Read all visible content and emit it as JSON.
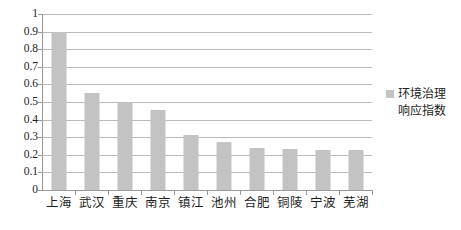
{
  "chart_data": {
    "type": "bar",
    "title": "",
    "subtitle": "",
    "xlabel": "",
    "ylabel": "",
    "ylim": [
      0,
      1
    ],
    "ytick_labels": [
      "1",
      "0.9",
      "0.8",
      "0.7",
      "0.6",
      "0.5",
      "0.4",
      "0.3",
      "0.2",
      "0.1",
      "0"
    ],
    "ytick_values": [
      1,
      0.9,
      0.8,
      0.7,
      0.6,
      0.5,
      0.4,
      0.3,
      0.2,
      0.1,
      0
    ],
    "grid": "horizontal",
    "legend_position": "right",
    "bar_color": "#c3c3c3",
    "gridline_color": "#b9b9b9",
    "axis_color": "#9a9a9a",
    "text_color": "#1d1d1d",
    "background_color": "#ffffff",
    "categories": [
      "上海",
      "武汉",
      "重庆",
      "南京",
      "镇江",
      "池州",
      "合肥",
      "铜陵",
      "宁波",
      "芜湖"
    ],
    "values": [
      0.895,
      0.55,
      0.5,
      0.455,
      0.31,
      0.27,
      0.24,
      0.235,
      0.23,
      0.23
    ],
    "series": [
      {
        "name": "环境治理响应指数",
        "values": [
          0.895,
          0.55,
          0.5,
          0.455,
          0.31,
          0.27,
          0.24,
          0.235,
          0.23,
          0.23
        ]
      }
    ]
  },
  "legend": {
    "marker_color": "#c3c3c3",
    "line1": "环境治理",
    "line2": "响应指数"
  }
}
